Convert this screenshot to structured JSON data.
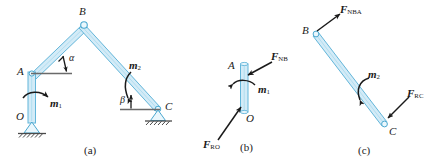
{
  "figure": {
    "type": "engineering-statics-free-body-diagram",
    "colors": {
      "member_fill": "#cfe9f5",
      "member_stroke": "#5fb4d8",
      "force_arrow": "#1a1a1a",
      "ground_line": "#555555",
      "background": "#ffffff"
    }
  },
  "panel_a": {
    "caption": "(a)",
    "description": "Complete frame O-A-B-C with applied couples m1 and m2",
    "nodes": [
      {
        "name": "A",
        "label": "A"
      },
      {
        "name": "B",
        "label": "B"
      },
      {
        "name": "C",
        "label": "C"
      },
      {
        "name": "O",
        "label": "O"
      }
    ],
    "angles": [
      {
        "name": "alpha",
        "label": "α",
        "at": "A",
        "between": "member AB and horizontal"
      },
      {
        "name": "beta",
        "label": "β",
        "at": "C",
        "between": "member BC and horizontal"
      }
    ],
    "couples": [
      {
        "name": "m1",
        "symbol": "m",
        "subscript": "1",
        "at": "member OA"
      },
      {
        "name": "m2",
        "symbol": "m",
        "subscript": "2",
        "at": "member BC"
      }
    ],
    "supports": [
      {
        "name": "pin-support-O",
        "at": "O",
        "kind": "pin"
      },
      {
        "name": "pin-support-C",
        "at": "C",
        "kind": "pin"
      }
    ]
  },
  "panel_b": {
    "caption": "(b)",
    "description": "Free body diagram of member OA",
    "nodes": [
      {
        "name": "A",
        "label": "A"
      },
      {
        "name": "O",
        "label": "O"
      }
    ],
    "forces": [
      {
        "name": "F-NB",
        "symbol": "F",
        "subscript": "NB",
        "at": "A"
      },
      {
        "name": "F-RO",
        "symbol": "F",
        "subscript": "RO",
        "at": "O"
      }
    ],
    "couples": [
      {
        "name": "m1",
        "symbol": "m",
        "subscript": "1"
      }
    ]
  },
  "panel_c": {
    "caption": "(c)",
    "description": "Free body diagram of member BC",
    "nodes": [
      {
        "name": "B",
        "label": "B"
      },
      {
        "name": "C",
        "label": "C"
      }
    ],
    "forces": [
      {
        "name": "F-NBA",
        "symbol": "F",
        "subscript": "NBA",
        "at": "B"
      },
      {
        "name": "F-RC",
        "symbol": "F",
        "subscript": "RC",
        "at": "C"
      }
    ],
    "couples": [
      {
        "name": "m2",
        "symbol": "m",
        "subscript": "2"
      }
    ]
  }
}
